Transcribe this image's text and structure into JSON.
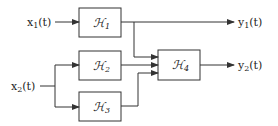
{
  "diagram": {
    "type": "block-diagram",
    "inputs": [
      {
        "id": "x1",
        "label": "x",
        "sub": "1",
        "suffix": "(t)"
      },
      {
        "id": "x2",
        "label": "x",
        "sub": "2",
        "suffix": "(t)"
      }
    ],
    "outputs": [
      {
        "id": "y1",
        "label": "y",
        "sub": "1",
        "suffix": "(t)"
      },
      {
        "id": "y2",
        "label": "y",
        "sub": "2",
        "suffix": "(t)"
      }
    ],
    "blocks": [
      {
        "id": "H1",
        "label": "ℋ",
        "sub": "1"
      },
      {
        "id": "H2",
        "label": "ℋ",
        "sub": "2"
      },
      {
        "id": "H3",
        "label": "ℋ",
        "sub": "3"
      },
      {
        "id": "H4",
        "label": "ℋ",
        "sub": "4"
      }
    ],
    "connections": [
      {
        "from": "x1",
        "to": "H1"
      },
      {
        "from": "x2",
        "to": "H2"
      },
      {
        "from": "x2",
        "to": "H3"
      },
      {
        "from": "H1",
        "to": "y1"
      },
      {
        "from": "H1",
        "to": "H4"
      },
      {
        "from": "H2",
        "to": "H4"
      },
      {
        "from": "H3",
        "to": "H4"
      },
      {
        "from": "H4",
        "to": "y2"
      }
    ],
    "colors": {
      "line": "#333333",
      "background": "#ffffff"
    }
  }
}
